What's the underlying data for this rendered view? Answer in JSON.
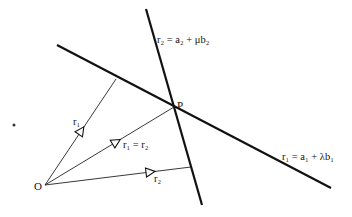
{
  "diagram": {
    "points": {
      "origin": {
        "label": "O",
        "x": 45,
        "y": 185
      },
      "intersection": {
        "label": "P",
        "x": 174,
        "y": 107
      }
    },
    "lines": [
      {
        "id": "line1",
        "equation": "r₁ = a₁ + λb₁",
        "from": [
          57,
          45
        ],
        "to": [
          331,
          188
        ]
      },
      {
        "id": "line2",
        "equation": "r₂ = a₂ + μb₂",
        "from": [
          146,
          9
        ],
        "to": [
          202,
          205
        ]
      }
    ],
    "vectors": [
      {
        "id": "r1",
        "label": "r₁",
        "from": [
          45,
          185
        ],
        "to": [
          116,
          79
        ]
      },
      {
        "id": "r1_eq_r2",
        "label": "r₁ = r₂",
        "from": [
          45,
          185
        ],
        "to": [
          174,
          107
        ]
      },
      {
        "id": "r2",
        "label": "r₂",
        "from": [
          45,
          185
        ],
        "to": [
          191,
          167
        ]
      }
    ],
    "labels": {
      "line1_eq": "r₁ = a₁ + λb₁",
      "line2_eq": "r₂ = a₂ + μb₂",
      "r1": "r₁",
      "r1_eq_r2": "r₁ = r₂",
      "r2": "r₂",
      "O": "O",
      "P": "P"
    }
  }
}
